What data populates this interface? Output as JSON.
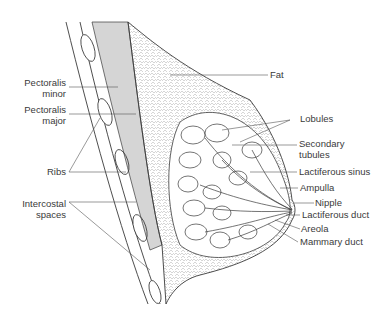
{
  "diagram": {
    "title": "",
    "left_labels": [
      {
        "id": "pectoralis-minor",
        "line1": "Pectoralis",
        "line2": "minor"
      },
      {
        "id": "pectoralis-major",
        "line1": "Pectoralis",
        "line2": "major"
      },
      {
        "id": "ribs",
        "line1": "Ribs"
      },
      {
        "id": "intercostal-spaces",
        "line1": "Intercostal",
        "line2": "spaces"
      }
    ],
    "right_labels": [
      {
        "id": "fat",
        "line1": "Fat"
      },
      {
        "id": "lobules",
        "line1": "Lobules"
      },
      {
        "id": "secondary-tubules",
        "line1": "Secondary",
        "line2": "tubules"
      },
      {
        "id": "lactiferous-sinus",
        "line1": "Lactiferous sinus"
      },
      {
        "id": "ampulla",
        "line1": "Ampulla"
      },
      {
        "id": "nipple",
        "line1": "Nipple"
      },
      {
        "id": "lactiferous-duct",
        "line1": "Lactiferous duct"
      },
      {
        "id": "areola",
        "line1": "Areola"
      },
      {
        "id": "mammary-duct",
        "line1": "Mammary duct"
      }
    ],
    "colors": {
      "line": "#3a3a3a",
      "background": "#ffffff"
    }
  }
}
